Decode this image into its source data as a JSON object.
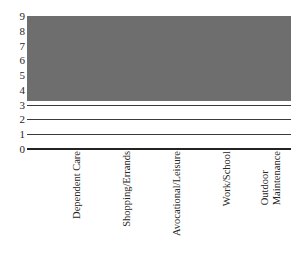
{
  "chart_data": {
    "type": "bar",
    "title": "",
    "subtitle": "",
    "xlabel": "",
    "ylabel": "",
    "categories": [
      "Dependent Care",
      "Shopping/Errands",
      "Avocational/Leisure",
      "Work/School",
      "Outdoor Maintenance"
    ],
    "values": [
      8.3,
      5.8,
      5.8,
      2.6,
      0.1
    ],
    "ylim": [
      0,
      9
    ],
    "yticks": [
      0,
      1,
      2,
      3,
      4,
      5,
      6,
      7,
      8,
      9
    ],
    "ytick_labels": [
      "0",
      "1",
      "2",
      "3",
      "4",
      "5",
      "6",
      "7",
      "8",
      "9"
    ],
    "grid": true,
    "grid_axis": "y",
    "legend": false,
    "legend_position": "none",
    "bar_color": "#6e6e6e",
    "gridline_color": "#3a3a3a",
    "axis_color": "#232323",
    "background_color": "#ffffff",
    "label_rotation": -90
  },
  "axis": {
    "y_tick_0": "0",
    "y_tick_1": "1",
    "y_tick_2": "2",
    "y_tick_3": "3",
    "y_tick_4": "4",
    "y_tick_5": "5",
    "y_tick_6": "6",
    "y_tick_7": "7",
    "y_tick_8": "8",
    "y_tick_9": "9"
  },
  "categories": {
    "cat_0": "Dependent Care",
    "cat_1": "Shopping/Errands",
    "cat_2": "Avocational/Leisure",
    "cat_3_line1": "Work/School",
    "cat_4_line1": "Outdoor",
    "cat_4_line2": "Maintenance"
  }
}
